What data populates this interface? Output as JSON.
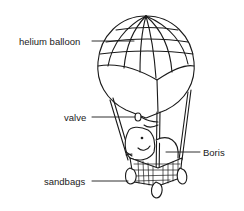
{
  "diagram": {
    "labels": [
      {
        "id": "helium-balloon",
        "text": "helium balloon",
        "x": 19,
        "y": 36
      },
      {
        "id": "valve",
        "text": "valve",
        "x": 64,
        "y": 112
      },
      {
        "id": "boris",
        "text": "Boris",
        "x": 203,
        "y": 148
      },
      {
        "id": "sandbags",
        "text": "sandbags",
        "x": 44,
        "y": 176
      }
    ],
    "colors": {
      "stroke": "#1a1a1a",
      "background": "#ffffff"
    }
  }
}
